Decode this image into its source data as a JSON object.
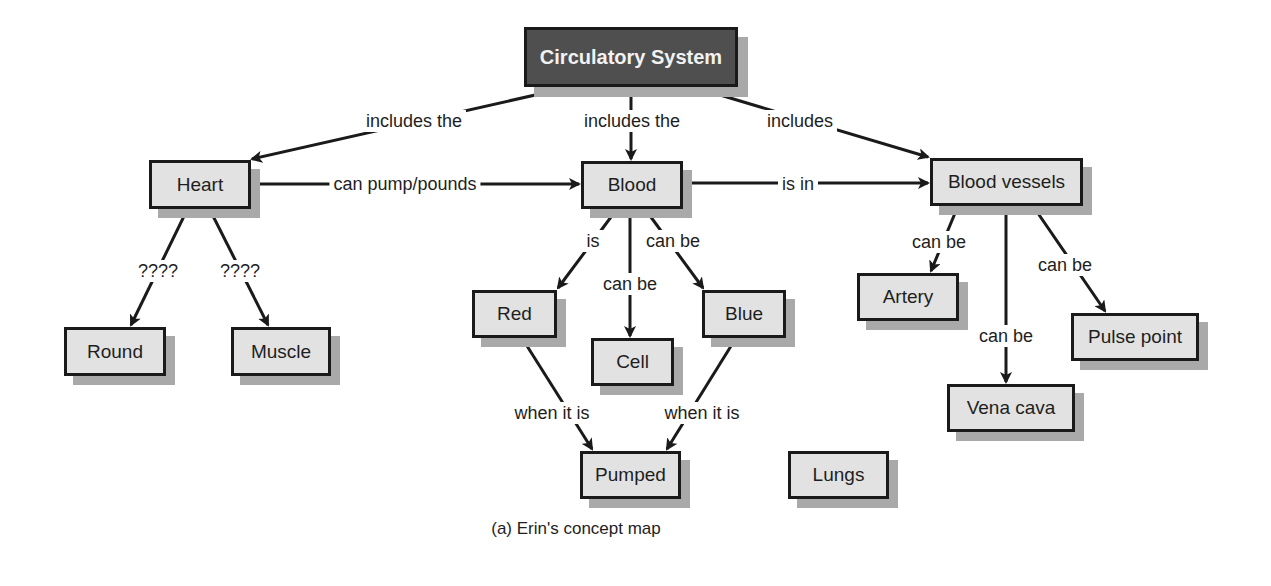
{
  "caption": "(a) Erin's concept map",
  "nodes": {
    "root": "Circulatory System",
    "heart": "Heart",
    "blood": "Blood",
    "vessels": "Blood vessels",
    "round": "Round",
    "muscle": "Muscle",
    "red": "Red",
    "cell": "Cell",
    "blue": "Blue",
    "artery": "Artery",
    "pulse": "Pulse point",
    "vena": "Vena cava",
    "pumped": "Pumped",
    "lungs": "Lungs"
  },
  "links": {
    "root_heart": "includes the",
    "root_blood": "includes the",
    "root_vessels": "includes",
    "heart_blood": "can pump/pounds",
    "blood_vessels": "is in",
    "heart_round": "????",
    "heart_muscle": "????",
    "blood_red": "is",
    "blood_cell": "can be",
    "blood_blue": "can be",
    "vessels_artery": "can be",
    "vessels_vena": "can be",
    "vessels_pulse": "can be",
    "red_pumped": "when it is",
    "blue_pumped": "when it is"
  },
  "colors": {
    "root_fill": "#4f4f4f",
    "node_fill": "#e2e2e2",
    "shadow": "#a9a9a9",
    "line": "#1a1a1a"
  }
}
